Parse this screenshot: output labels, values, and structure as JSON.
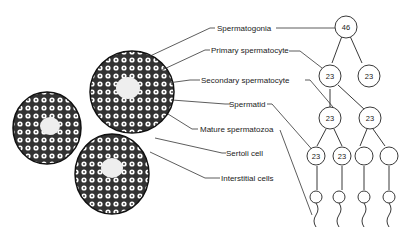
{
  "labels": {
    "spermatogonia": "Spermatogonia",
    "primary": "Primary spermatocyte",
    "secondary": "Secondary spermatocyte",
    "spermatid": "Spermatid",
    "mature": "Mature spermatozoa",
    "sertoli": "Sertoli cell",
    "interstitial": "Interstitial cells"
  },
  "tree": {
    "spermatogonia": "46",
    "primary_left": "23",
    "primary_right": "23",
    "secondary_left": "23",
    "secondary_right": "23",
    "spermatid_1": "23",
    "spermatid_2": "23",
    "spermatid_3": "",
    "spermatid_4": ""
  }
}
